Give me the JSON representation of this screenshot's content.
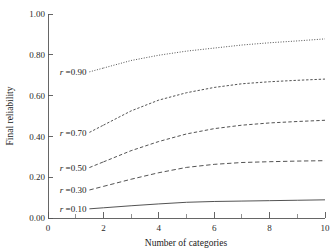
{
  "chart_data": {
    "type": "line",
    "title": "",
    "subtitle": "",
    "xlabel": "Number of categories",
    "ylabel": "Final reliability",
    "xlim": [
      0,
      10
    ],
    "ylim": [
      0.0,
      1.0
    ],
    "grid": false,
    "legend_position": "inline-left-of-curve",
    "x_ticks": [
      0,
      2,
      4,
      6,
      8,
      10
    ],
    "x_tick_labels": [
      "0",
      "2",
      "4",
      "6",
      "8",
      "10"
    ],
    "x_minor_ticks": [
      1,
      3,
      5,
      7,
      9
    ],
    "y_ticks": [
      0.0,
      0.2,
      0.4,
      0.6,
      0.8,
      1.0
    ],
    "y_tick_labels": [
      "0.00",
      "0.20",
      "0.40",
      "0.60",
      "0.80",
      "1.00"
    ],
    "x": [
      2,
      3,
      4,
      5,
      6,
      7,
      8,
      9,
      10
    ],
    "series": [
      {
        "name": "r = 0.90",
        "label_prefix": "r",
        "label_eq": "=",
        "label_value": "0.90",
        "dash": "dotted",
        "values": [
          0.735,
          0.772,
          0.798,
          0.818,
          0.833,
          0.848,
          0.859,
          0.868,
          0.878
        ]
      },
      {
        "name": "r = 0.70",
        "label_prefix": "r",
        "label_eq": "=",
        "label_value": "0.70",
        "dash": "dashed-fine",
        "values": [
          0.455,
          0.525,
          0.578,
          0.614,
          0.64,
          0.658,
          0.668,
          0.675,
          0.681
        ]
      },
      {
        "name": "r = 0.50",
        "label_prefix": "r",
        "label_eq": "=",
        "label_value": "0.50",
        "dash": "dashed-medium",
        "values": [
          0.275,
          0.33,
          0.375,
          0.412,
          0.438,
          0.455,
          0.466,
          0.473,
          0.479
        ]
      },
      {
        "name": "r = 0.30",
        "label_prefix": "r",
        "label_eq": "=",
        "label_value": "0.30",
        "dash": "dashed-long",
        "values": [
          0.155,
          0.19,
          0.222,
          0.248,
          0.263,
          0.272,
          0.276,
          0.279,
          0.281
        ]
      },
      {
        "name": "r = 0.10",
        "label_prefix": "r",
        "label_eq": "=",
        "label_value": "0.10",
        "dash": "solid",
        "values": [
          0.05,
          0.06,
          0.069,
          0.077,
          0.081,
          0.083,
          0.085,
          0.087,
          0.089
        ]
      }
    ],
    "colors": {
      "curve": "#4a4a4a",
      "axis": "#555555",
      "text": "#1a1a1a",
      "background": "#ffffff"
    }
  }
}
